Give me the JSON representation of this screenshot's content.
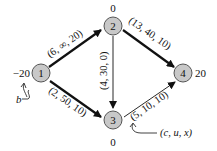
{
  "colors": {
    "node_fill": "#c8c8c8",
    "node_stroke": "#555555",
    "edge": "#111111",
    "text": "#111111"
  },
  "nodes": [
    {
      "id": "1",
      "label": "1",
      "supply": "−20"
    },
    {
      "id": "2",
      "label": "2",
      "supply": "0"
    },
    {
      "id": "3",
      "label": "3",
      "supply": "0"
    },
    {
      "id": "4",
      "label": "4",
      "supply": "20"
    }
  ],
  "edges": [
    {
      "from": "1",
      "to": "2",
      "label": "(6, ∞, 20)",
      "bold": true
    },
    {
      "from": "1",
      "to": "3",
      "label": "(2, 50, 10)",
      "bold": true
    },
    {
      "from": "2",
      "to": "3",
      "label": "(4, 30, 0)",
      "bold": false
    },
    {
      "from": "2",
      "to": "4",
      "label": "(13, 40, 10)",
      "bold": true
    },
    {
      "from": "3",
      "to": "4",
      "label": "(5, 10, 10)",
      "bold": false
    }
  ],
  "annotations": {
    "b_label": "b",
    "edge_legend": "(c, u, x)"
  }
}
